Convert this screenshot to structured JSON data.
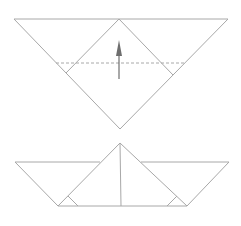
{
  "diagram": {
    "type": "origami-fold-steps",
    "colors": {
      "line": "#a8a8a8",
      "arrow": "#6e6e6e",
      "background": "#ffffff"
    },
    "steps": [
      {
        "name": "step-1-fold-up",
        "outer_triangle": [
          [
            14,
            19
          ],
          [
            228,
            19
          ],
          [
            120,
            129
          ]
        ],
        "inner_diamond": [
          [
            119,
            19
          ],
          [
            173,
            75
          ],
          [
            120,
            129
          ],
          [
            66,
            73
          ]
        ],
        "valley_fold_line": {
          "from": [
            56,
            63
          ],
          "to": [
            185,
            63
          ],
          "style": "dashed"
        },
        "arrow": {
          "from": [
            119,
            79
          ],
          "to": [
            119,
            40
          ],
          "direction": "up"
        }
      },
      {
        "name": "step-2-boat-result",
        "left_flap": [
          [
            15,
            162
          ],
          [
            100,
            162
          ],
          [
            58,
            206
          ]
        ],
        "right_flap": [
          [
            141,
            162
          ],
          [
            229,
            162
          ],
          [
            187,
            206
          ]
        ],
        "center_triangle": [
          [
            120,
            143
          ],
          [
            58,
            206
          ],
          [
            187,
            206
          ]
        ],
        "center_line": {
          "from": [
            120,
            143
          ],
          "to": [
            121,
            206
          ]
        },
        "base_line": {
          "from": [
            58,
            206
          ],
          "to": [
            187,
            206
          ]
        },
        "corner_marks": [
          "left",
          "right"
        ]
      }
    ]
  }
}
